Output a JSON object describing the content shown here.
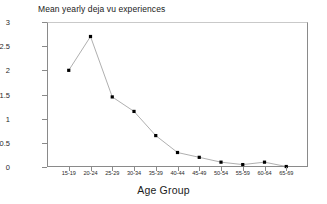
{
  "chart_data": {
    "type": "line",
    "title": "Mean yearly deja vu experiences",
    "xlabel": "Age Group",
    "ylabel": "",
    "categories": [
      "15-19",
      "20-24",
      "25-29",
      "30-34",
      "35-39",
      "40-44",
      "45-49",
      "50-54",
      "55-59",
      "60-64",
      "65-69"
    ],
    "values": [
      2.0,
      2.7,
      1.45,
      1.15,
      0.65,
      0.3,
      0.2,
      0.1,
      0.05,
      0.1,
      0.01
    ],
    "series": [
      {
        "name": "Mean yearly deja vu experiences",
        "values": [
          2.0,
          2.7,
          1.45,
          1.15,
          0.65,
          0.3,
          0.2,
          0.1,
          0.05,
          0.1,
          0.01
        ]
      }
    ],
    "ylim": [
      0,
      3
    ],
    "ytick_labels": [
      "0",
      "0.5",
      "1",
      "1.5",
      "2",
      "2.5",
      "3"
    ],
    "ytick_values": [
      0,
      0.5,
      1,
      1.5,
      2,
      2.5,
      3
    ],
    "grid": false,
    "legend": "none",
    "marker": "square",
    "marker_color": "#000000",
    "line_color": "#9a9a9a",
    "background_color": "#ffffff",
    "axis_color": "#8a8a8a"
  }
}
